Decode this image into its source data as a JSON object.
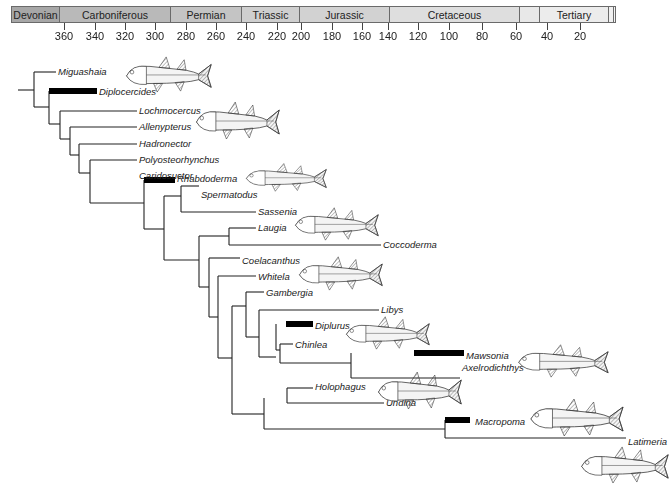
{
  "timescale": {
    "periods": [
      {
        "name": "Devonian",
        "x0": 0,
        "x1": 48,
        "color": "#a7a7a7"
      },
      {
        "name": "Carboniferous",
        "x0": 48,
        "x1": 159,
        "color": "#b9b9b9"
      },
      {
        "name": "Permian",
        "x0": 159,
        "x1": 230,
        "color": "#c4c4c4"
      },
      {
        "name": "Triassic",
        "x0": 230,
        "x1": 288,
        "color": "#cfcfcf"
      },
      {
        "name": "Jurassic",
        "x0": 288,
        "x1": 378,
        "color": "#d2d2d2"
      },
      {
        "name": "Cretaceous",
        "x0": 378,
        "x1": 508,
        "color": "#dedede"
      },
      {
        "name": "",
        "x0": 508,
        "x1": 528,
        "color": "#e8e8e8"
      },
      {
        "name": "Tertiary",
        "x0": 528,
        "x1": 597,
        "color": "#ececec"
      },
      {
        "name": "",
        "x0": 597,
        "x1": 602,
        "color": "#f0f0f0"
      },
      {
        "name": "",
        "x0": 602,
        "x1": 605,
        "color": "#f4f4f4"
      }
    ],
    "ticks": [
      {
        "label": "360",
        "x": 64
      },
      {
        "label": "340",
        "x": 95
      },
      {
        "label": "320",
        "x": 125
      },
      {
        "label": "300",
        "x": 155
      },
      {
        "label": "280",
        "x": 186
      },
      {
        "label": "260",
        "x": 216
      },
      {
        "label": "240",
        "x": 246
      },
      {
        "label": "220",
        "x": 277
      },
      {
        "label": "200",
        "x": 301
      },
      {
        "label": "180",
        "x": 332
      },
      {
        "label": "160",
        "x": 362
      },
      {
        "label": "140",
        "x": 388
      },
      {
        "label": "120",
        "x": 418
      },
      {
        "label": "100",
        "x": 449
      },
      {
        "label": "80",
        "x": 482
      },
      {
        "label": "60",
        "x": 516
      },
      {
        "label": "40",
        "x": 547
      },
      {
        "label": "20",
        "x": 580
      }
    ]
  },
  "taxa": [
    {
      "name": "Miguashaia",
      "x": 58,
      "y": 66
    },
    {
      "name": "Diplocercides",
      "x": 99,
      "y": 86
    },
    {
      "name": "Lochmocercus",
      "x": 139,
      "y": 105
    },
    {
      "name": "Allenypterus",
      "x": 139,
      "y": 121
    },
    {
      "name": "Hadronector",
      "x": 139,
      "y": 138
    },
    {
      "name": "Polyosteorhynchus",
      "x": 139,
      "y": 154
    },
    {
      "name": "Caridosuctor",
      "x": 139,
      "y": 170
    },
    {
      "name": "Rhabdoderma",
      "x": 177,
      "y": 173
    },
    {
      "name": "Spermatodus",
      "x": 201,
      "y": 189
    },
    {
      "name": "Sassenia",
      "x": 258,
      "y": 206
    },
    {
      "name": "Laugia",
      "x": 258,
      "y": 222
    },
    {
      "name": "Coccoderma",
      "x": 383,
      "y": 239
    },
    {
      "name": "Coelacanthus",
      "x": 242,
      "y": 255
    },
    {
      "name": "Whitela",
      "x": 258,
      "y": 271
    },
    {
      "name": "Gambergia",
      "x": 266,
      "y": 287
    },
    {
      "name": "Libys",
      "x": 381,
      "y": 304
    },
    {
      "name": "Diplurus",
      "x": 315,
      "y": 320
    },
    {
      "name": "Chinlea",
      "x": 295,
      "y": 339
    },
    {
      "name": "Mawsonia",
      "x": 466,
      "y": 350
    },
    {
      "name": "Axelrodichthys",
      "x": 462,
      "y": 362
    },
    {
      "name": "Holophagus",
      "x": 315,
      "y": 381
    },
    {
      "name": "Undina",
      "x": 386,
      "y": 397
    },
    {
      "name": "Macropoma",
      "x": 475,
      "y": 416
    },
    {
      "name": "Latimeria",
      "x": 628,
      "y": 436
    }
  ],
  "tree": {
    "lines": [
      [
        18,
        90,
        34,
        90
      ],
      [
        34,
        72,
        34,
        107
      ],
      [
        34,
        72,
        56,
        72
      ],
      [
        34,
        107,
        49,
        107
      ],
      [
        49,
        91,
        49,
        124
      ],
      [
        49,
        124,
        60,
        124
      ],
      [
        60,
        111,
        60,
        139
      ],
      [
        60,
        111,
        137,
        111
      ],
      [
        60,
        139,
        70,
        139
      ],
      [
        70,
        127,
        70,
        155
      ],
      [
        70,
        127,
        137,
        127
      ],
      [
        70,
        155,
        79,
        155
      ],
      [
        79,
        144,
        79,
        173
      ],
      [
        79,
        144,
        137,
        144
      ],
      [
        79,
        173,
        90,
        173
      ],
      [
        90,
        160,
        90,
        203
      ],
      [
        90,
        160,
        137,
        160
      ],
      [
        90,
        203,
        144,
        203
      ],
      [
        144,
        180,
        144,
        229
      ],
      [
        144,
        229,
        164,
        229
      ],
      [
        164,
        196,
        164,
        260
      ],
      [
        164,
        196,
        181,
        196
      ],
      [
        164,
        260,
        199,
        260
      ],
      [
        181,
        186,
        181,
        212
      ],
      [
        181,
        186,
        199,
        186
      ],
      [
        181,
        212,
        256,
        212
      ],
      [
        199,
        236,
        199,
        287
      ],
      [
        199,
        236,
        229,
        236
      ],
      [
        199,
        287,
        209,
        287
      ],
      [
        229,
        228,
        229,
        245
      ],
      [
        229,
        228,
        256,
        228
      ],
      [
        229,
        245,
        381,
        245
      ],
      [
        209,
        258,
        209,
        317
      ],
      [
        209,
        258,
        240,
        258
      ],
      [
        209,
        317,
        218,
        317
      ],
      [
        218,
        276,
        218,
        358
      ],
      [
        218,
        276,
        256,
        276
      ],
      [
        218,
        358,
        232,
        358
      ],
      [
        232,
        306,
        232,
        414
      ],
      [
        232,
        306,
        246,
        306
      ],
      [
        232,
        414,
        264,
        414
      ],
      [
        246,
        292,
        246,
        337
      ],
      [
        246,
        292,
        264,
        292
      ],
      [
        246,
        337,
        259,
        337
      ],
      [
        259,
        310,
        259,
        357
      ],
      [
        259,
        310,
        379,
        310
      ],
      [
        259,
        357,
        276,
        357
      ],
      [
        276,
        324,
        276,
        350
      ],
      [
        276,
        350,
        280,
        350
      ],
      [
        280,
        344,
        280,
        363
      ],
      [
        280,
        344,
        293,
        344
      ],
      [
        280,
        363,
        351,
        363
      ],
      [
        351,
        353,
        351,
        378
      ],
      [
        351,
        378,
        460,
        378
      ],
      [
        264,
        398,
        264,
        429
      ],
      [
        264,
        429,
        445,
        429
      ],
      [
        287,
        388,
        287,
        403
      ],
      [
        287,
        388,
        313,
        388
      ],
      [
        287,
        403,
        384,
        403
      ],
      [
        445,
        420,
        445,
        438
      ],
      [
        445,
        438,
        626,
        438
      ]
    ],
    "bars": [
      {
        "taxon": "Diplocercides",
        "x0": 49,
        "x1": 97,
        "y": 91
      },
      {
        "taxon": "Rhabdoderma",
        "x0": 144,
        "x1": 175,
        "y": 180
      },
      {
        "taxon": "Diplurus",
        "x0": 286,
        "x1": 313,
        "y": 324
      },
      {
        "taxon": "Mawsonia",
        "x0": 414,
        "x1": 464,
        "y": 353
      },
      {
        "taxon": "Macropoma",
        "x0": 445,
        "x1": 470,
        "y": 420
      }
    ]
  },
  "fish_illustrations": [
    {
      "near": "Miguashaia",
      "x": 123,
      "y": 55,
      "w": 90,
      "h": 38
    },
    {
      "near": "Allenypterus",
      "x": 193,
      "y": 100,
      "w": 88,
      "h": 40
    },
    {
      "near": "Rhabdoderma",
      "x": 243,
      "y": 162,
      "w": 85,
      "h": 30
    },
    {
      "near": "Sassenia",
      "x": 292,
      "y": 206,
      "w": 88,
      "h": 35
    },
    {
      "near": "Whitela",
      "x": 296,
      "y": 255,
      "w": 88,
      "h": 36
    },
    {
      "near": "Diplurus",
      "x": 343,
      "y": 315,
      "w": 88,
      "h": 35
    },
    {
      "near": "Axelrodichthys",
      "x": 375,
      "y": 370,
      "w": 88,
      "h": 40
    },
    {
      "near": "Mawsonia",
      "x": 515,
      "y": 343,
      "w": 95,
      "h": 35
    },
    {
      "near": "Macropoma",
      "x": 527,
      "y": 397,
      "w": 98,
      "h": 40
    },
    {
      "near": "Latimeria",
      "x": 578,
      "y": 445,
      "w": 92,
      "h": 39
    }
  ]
}
